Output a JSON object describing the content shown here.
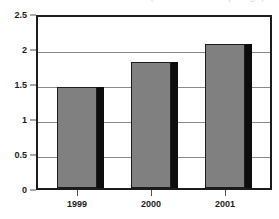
{
  "chart_data": {
    "type": "bar",
    "title": "",
    "title_fragment": "(cut off above top edge)",
    "xlabel": "",
    "ylabel": "",
    "categories": [
      "1999",
      "2000",
      "2001"
    ],
    "values": [
      1.47,
      1.84,
      2.1
    ],
    "series": [
      {
        "name": "",
        "values": [
          1.47,
          1.84,
          2.1
        ]
      }
    ],
    "ylim": [
      0,
      2.5
    ],
    "y_ticks": [
      "0",
      "0.5",
      "1",
      "1.5",
      "2",
      "2.5"
    ],
    "y_tick_values": [
      0,
      0.5,
      1,
      1.5,
      2,
      2.5
    ],
    "grid": true,
    "grid_axis": "y",
    "legend": false,
    "legend_position": "none",
    "colors": {
      "bar_fill": "#808080",
      "bar_edge": "#1c1c1c",
      "bar_shadow": "#0d0d0d",
      "gridline": "#8a8a8a",
      "frame": "#1c1c1c",
      "text": "#1c1c1c",
      "background": "#ffffff"
    }
  },
  "axes": {
    "y": {
      "ticks": [
        {
          "label": "2.5",
          "value": 2.5
        },
        {
          "label": "2",
          "value": 2.0
        },
        {
          "label": "1.5",
          "value": 1.5
        },
        {
          "label": "1",
          "value": 1.0
        },
        {
          "label": "0.5",
          "value": 0.5
        },
        {
          "label": "0",
          "value": 0.0
        }
      ]
    },
    "x": {
      "ticks": [
        {
          "label": "1999"
        },
        {
          "label": "2000"
        },
        {
          "label": "2001"
        }
      ]
    }
  }
}
